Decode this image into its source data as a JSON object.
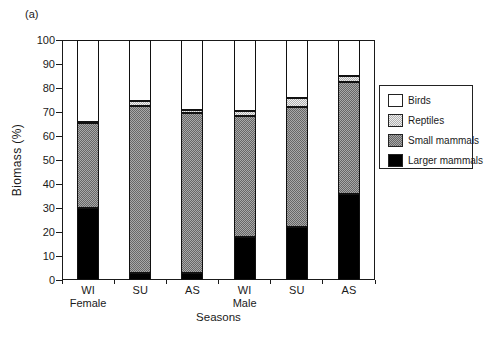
{
  "figure_label": "(a)",
  "chart_data": {
    "type": "bar",
    "stacked": true,
    "title": "",
    "xlabel": "Seasons",
    "ylabel": "Biomass (%)",
    "ylim": [
      0,
      100
    ],
    "y_ticks": [
      0,
      10,
      20,
      30,
      40,
      50,
      60,
      70,
      80,
      90,
      100
    ],
    "categories": [
      "WI",
      "SU",
      "AS",
      "WI",
      "SU",
      "AS"
    ],
    "groups": [
      {
        "label": "Female",
        "bar_index": 0
      },
      {
        "label": "Male",
        "bar_index": 3
      }
    ],
    "series": [
      {
        "name": "Larger mammals",
        "key": "larger_mammals",
        "color": "#000000",
        "pattern": "solid",
        "values": [
          30,
          3,
          3,
          18,
          22,
          36
        ]
      },
      {
        "name": "Small mammals",
        "key": "small_mammals",
        "color": "#8c8c8c",
        "pattern": "dark-checker",
        "values": [
          35.5,
          69.5,
          66.5,
          50.5,
          50,
          46.5
        ]
      },
      {
        "name": "Reptiles",
        "key": "reptiles",
        "color": "#cdcdcd",
        "pattern": "light-checker",
        "values": [
          0.5,
          2,
          1.5,
          2,
          4,
          2.5
        ]
      },
      {
        "name": "Birds",
        "key": "birds",
        "color": "#ffffff",
        "pattern": "solid",
        "values": [
          34,
          25.5,
          29,
          29.5,
          24,
          15
        ]
      }
    ],
    "legend": {
      "position": "right",
      "items": [
        "Birds",
        "Reptiles",
        "Small mammals",
        "Larger mammals"
      ]
    }
  }
}
